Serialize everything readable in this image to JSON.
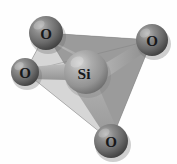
{
  "figure": {
    "name": "silicon-oxygen-tetrahedron",
    "background_color": "#fefefe",
    "width": 177,
    "height": 164
  },
  "palette": {
    "face_light": "#d4d4d4",
    "face_medium": "#a8a8a8",
    "face_dark": "#8f8f8f",
    "face_darkest": "#848484",
    "bond_light": "#c9c9c9",
    "bond_medium": "#a5a5a5",
    "bond_dark": "#8c8c8c",
    "sphere_oxygen_base": "#6f6f6f",
    "sphere_oxygen_highlight": "#b4b4b4",
    "sphere_oxygen_shadow": "#3f3f3f",
    "sphere_silicon_base": "#9b9b9b",
    "sphere_silicon_highlight": "#cccccc",
    "sphere_silicon_shadow": "#6a6a6a",
    "label_color": "#17181a",
    "edge_stroke": "#7a7a7a"
  },
  "atoms": [
    {
      "id": "o-top-left",
      "element": "O",
      "label": "O",
      "role": "oxygen",
      "cx": 46,
      "cy": 33,
      "r": 17,
      "label_x": 46,
      "label_y": 34
    },
    {
      "id": "o-top-right",
      "element": "O",
      "label": "O",
      "role": "oxygen",
      "cx": 152,
      "cy": 40,
      "r": 16,
      "label_x": 152,
      "label_y": 41
    },
    {
      "id": "o-left",
      "element": "O",
      "label": "O",
      "role": "oxygen",
      "cx": 25,
      "cy": 72,
      "r": 14,
      "label_x": 25,
      "label_y": 73
    },
    {
      "id": "o-bottom",
      "element": "O",
      "label": "O",
      "role": "oxygen",
      "cx": 111,
      "cy": 141,
      "r": 17,
      "label_x": 111,
      "label_y": 142
    },
    {
      "id": "si-center",
      "element": "Si",
      "label": "Si",
      "role": "silicon",
      "cx": 86,
      "cy": 72,
      "r": 22,
      "label_x": 84,
      "label_y": 73
    }
  ],
  "bonds": [
    {
      "id": "bond-si-o-top-left",
      "from": "si-center",
      "to": "o-top-left",
      "shade": "#b0b0b0"
    },
    {
      "id": "bond-si-o-top-right",
      "from": "si-center",
      "to": "o-top-right",
      "shade": "#9d9d9d"
    },
    {
      "id": "bond-si-o-left",
      "from": "si-center",
      "to": "o-left",
      "shade": "#bdbdbd"
    },
    {
      "id": "bond-si-o-bottom",
      "from": "si-center",
      "to": "o-bottom",
      "shade": "#a0a0a0"
    }
  ],
  "faces": [
    {
      "id": "face-left-front",
      "vertices": "o-top-left,o-left,o-bottom",
      "fill": "#d6d6d6"
    },
    {
      "id": "face-right-front",
      "vertices": "o-top-left,o-top-right,o-bottom",
      "fill": "#9b9b9b"
    },
    {
      "id": "face-top-back",
      "vertices": "o-top-left,o-top-right,o-left",
      "fill": "#8e8e8e"
    },
    {
      "id": "face-bottom-back",
      "vertices": "o-left,o-top-right,o-bottom",
      "fill": "#aeaeae"
    }
  ],
  "caption": {
    "formula": "SiO4",
    "center_atom": "Si",
    "vertex_atom": "O",
    "vertex_count": 4,
    "geometry": "tetrahedral"
  }
}
